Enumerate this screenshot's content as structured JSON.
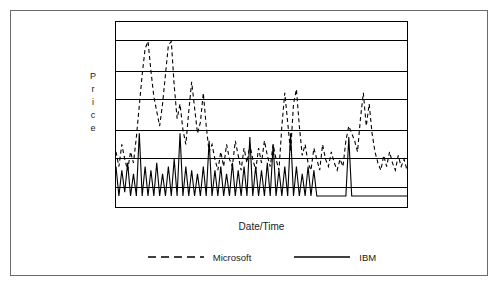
{
  "figure": {
    "background": "#ffffff",
    "frame_color": "#6b6b6b",
    "axis_color": "#000000"
  },
  "axes": {
    "ylabel_letters": [
      "P",
      "r",
      "i",
      "c",
      "e"
    ],
    "ylabel": "Price",
    "xlabel": "Date/Time"
  },
  "legend": {
    "items": [
      {
        "label": "Microsoft",
        "style": "dashed",
        "color": "#000000"
      },
      {
        "label": "IBM",
        "style": "solid",
        "color": "#000000"
      }
    ]
  },
  "chart_data": {
    "type": "line",
    "title": "",
    "xlabel": "Date/Time",
    "ylabel": "Price",
    "grid": true,
    "grid_orientation": "horizontal",
    "gridline_count": 5,
    "gridline_y_fractions": [
      0.1,
      0.265,
      0.415,
      0.585,
      0.73,
      0.89
    ],
    "legend_position": "bottom",
    "xlim": [
      0,
      100
    ],
    "ylim": [
      0,
      1
    ],
    "xticklabels": [],
    "yticklabels": [],
    "series": [
      {
        "name": "Microsoft",
        "style": "dashed",
        "color": "#000000",
        "x": [
          0,
          1,
          2,
          3,
          4,
          5,
          6,
          7,
          8,
          9,
          10,
          11,
          12,
          13,
          14,
          15,
          16,
          17,
          18,
          19,
          20,
          21,
          22,
          23,
          24,
          25,
          26,
          27,
          28,
          29,
          30,
          31,
          32,
          33,
          34,
          35,
          36,
          37,
          38,
          39,
          40,
          41,
          42,
          43,
          44,
          45,
          46,
          47,
          48,
          49,
          50,
          51,
          52,
          53,
          54,
          55,
          56,
          57,
          58,
          59,
          60,
          61,
          62,
          63,
          64,
          65,
          66,
          67,
          68,
          69,
          70,
          71,
          72,
          73,
          74,
          75,
          76,
          77,
          78,
          79,
          80,
          81,
          82,
          83,
          84,
          85,
          86,
          87,
          88,
          89,
          90,
          91,
          92,
          93,
          94,
          95,
          96,
          97,
          98,
          99,
          100
        ],
        "y": [
          0.3,
          0.22,
          0.34,
          0.26,
          0.2,
          0.3,
          0.24,
          0.38,
          0.55,
          0.72,
          0.86,
          0.9,
          0.74,
          0.6,
          0.52,
          0.44,
          0.56,
          0.72,
          0.88,
          0.9,
          0.66,
          0.48,
          0.56,
          0.42,
          0.34,
          0.52,
          0.68,
          0.54,
          0.4,
          0.46,
          0.62,
          0.44,
          0.3,
          0.34,
          0.26,
          0.2,
          0.3,
          0.22,
          0.34,
          0.26,
          0.22,
          0.36,
          0.28,
          0.2,
          0.32,
          0.24,
          0.34,
          0.26,
          0.2,
          0.32,
          0.24,
          0.36,
          0.28,
          0.22,
          0.34,
          0.26,
          0.2,
          0.44,
          0.62,
          0.46,
          0.3,
          0.56,
          0.64,
          0.44,
          0.28,
          0.34,
          0.24,
          0.2,
          0.32,
          0.26,
          0.2,
          0.34,
          0.26,
          0.22,
          0.3,
          0.24,
          0.2,
          0.26,
          0.22,
          0.36,
          0.44,
          0.4,
          0.36,
          0.3,
          0.48,
          0.62,
          0.44,
          0.56,
          0.4,
          0.3,
          0.24,
          0.2,
          0.28,
          0.22,
          0.3,
          0.24,
          0.2,
          0.28,
          0.22,
          0.26,
          0.2
        ]
      },
      {
        "name": "IBM",
        "style": "solid",
        "color": "#000000",
        "x": [
          0,
          1,
          2,
          3,
          4,
          5,
          6,
          7,
          8,
          9,
          10,
          11,
          12,
          13,
          14,
          15,
          16,
          17,
          18,
          19,
          20,
          21,
          22,
          23,
          24,
          25,
          26,
          27,
          28,
          29,
          30,
          31,
          32,
          33,
          34,
          35,
          36,
          37,
          38,
          39,
          40,
          41,
          42,
          43,
          44,
          45,
          46,
          47,
          48,
          49,
          50,
          51,
          52,
          53,
          54,
          55,
          56,
          57,
          58,
          59,
          60,
          61,
          62,
          63,
          64,
          65,
          66,
          67,
          68,
          69,
          70,
          71,
          72,
          73,
          74,
          75,
          76,
          77,
          78,
          79,
          80,
          81,
          82,
          83,
          84,
          85,
          86,
          87,
          88,
          89,
          90,
          91,
          92,
          93,
          94,
          95,
          96,
          97,
          98,
          99,
          100
        ],
        "y": [
          0.22,
          0.06,
          0.2,
          0.08,
          0.24,
          0.06,
          0.18,
          0.06,
          0.4,
          0.06,
          0.22,
          0.06,
          0.2,
          0.06,
          0.24,
          0.06,
          0.18,
          0.06,
          0.22,
          0.06,
          0.26,
          0.06,
          0.4,
          0.06,
          0.22,
          0.06,
          0.2,
          0.06,
          0.18,
          0.06,
          0.22,
          0.06,
          0.36,
          0.06,
          0.2,
          0.06,
          0.22,
          0.06,
          0.18,
          0.06,
          0.24,
          0.06,
          0.2,
          0.06,
          0.22,
          0.06,
          0.38,
          0.06,
          0.22,
          0.06,
          0.2,
          0.06,
          0.24,
          0.06,
          0.34,
          0.06,
          0.2,
          0.06,
          0.22,
          0.06,
          0.4,
          0.06,
          0.22,
          0.06,
          0.18,
          0.06,
          0.22,
          0.06,
          0.2,
          0.06,
          0.06,
          0.06,
          0.06,
          0.06,
          0.06,
          0.06,
          0.06,
          0.06,
          0.06,
          0.06,
          0.38,
          0.06,
          0.06,
          0.06,
          0.06,
          0.06,
          0.06,
          0.06,
          0.06,
          0.06,
          0.06,
          0.06,
          0.06,
          0.06,
          0.06,
          0.06,
          0.06,
          0.06,
          0.06,
          0.06,
          0.06
        ]
      }
    ]
  }
}
